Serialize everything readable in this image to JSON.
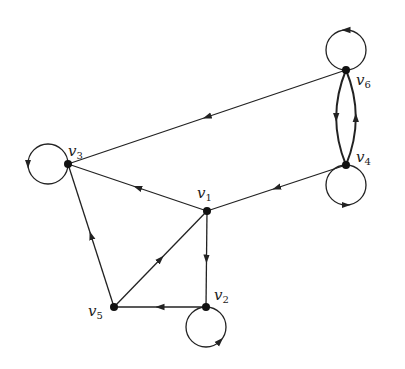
{
  "diagram": {
    "type": "directed-graph",
    "colors": {
      "stroke": "#222222",
      "node": "#111111",
      "background": "#ffffff"
    },
    "nodes": [
      {
        "id": "v1",
        "label": "v",
        "sub": "1",
        "x": 207,
        "y": 211,
        "lx": 197,
        "ly": 198
      },
      {
        "id": "v2",
        "label": "v",
        "sub": "2",
        "x": 206,
        "y": 307,
        "lx": 214,
        "ly": 300
      },
      {
        "id": "v3",
        "label": "v",
        "sub": "3",
        "x": 68,
        "y": 164,
        "lx": 68,
        "ly": 156
      },
      {
        "id": "v4",
        "label": "v",
        "sub": "4",
        "x": 346,
        "y": 165,
        "lx": 356,
        "ly": 162
      },
      {
        "id": "v5",
        "label": "v",
        "sub": "5",
        "x": 114,
        "y": 307,
        "lx": 88,
        "ly": 316
      },
      {
        "id": "v6",
        "label": "v",
        "sub": "6",
        "x": 346,
        "y": 70,
        "lx": 356,
        "ly": 85
      }
    ],
    "edges": [
      {
        "from": "v6",
        "to": "v3",
        "type": "line"
      },
      {
        "from": "v4",
        "to": "v1",
        "type": "line"
      },
      {
        "from": "v1",
        "to": "v3",
        "type": "line"
      },
      {
        "from": "v1",
        "to": "v2",
        "type": "line"
      },
      {
        "from": "v2",
        "to": "v5",
        "type": "line"
      },
      {
        "from": "v5",
        "to": "v1",
        "type": "line"
      },
      {
        "from": "v5",
        "to": "v3",
        "type": "line"
      },
      {
        "from": "v6",
        "to": "v4",
        "type": "curve-left"
      },
      {
        "from": "v4",
        "to": "v6",
        "type": "curve-right"
      }
    ],
    "loops": [
      {
        "node": "v3",
        "cx": 48,
        "cy": 164,
        "r": 20,
        "position": "left"
      },
      {
        "node": "v6",
        "cx": 346,
        "cy": 50,
        "r": 20,
        "position": "top"
      },
      {
        "node": "v4",
        "cx": 346,
        "cy": 185,
        "r": 20,
        "position": "bottom"
      },
      {
        "node": "v2",
        "cx": 206,
        "cy": 327,
        "r": 20,
        "position": "bottom"
      }
    ]
  }
}
